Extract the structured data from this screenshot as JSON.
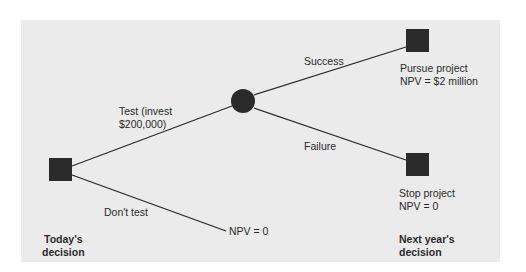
{
  "diagram": {
    "type": "decision-tree",
    "nodes": {
      "today": {
        "shape": "square",
        "kind": "decision"
      },
      "chance": {
        "shape": "circle",
        "kind": "chance"
      },
      "pursue": {
        "shape": "square",
        "kind": "decision",
        "label_line1": "Pursue project",
        "label_line2": "NPV = $2 million"
      },
      "stop": {
        "shape": "square",
        "kind": "decision",
        "label_line1": "Stop project",
        "label_line2": "NPV = 0"
      }
    },
    "branches": {
      "test": {
        "label_line1": "Test (invest",
        "label_line2": "$200,000)"
      },
      "dont_test": {
        "label": "Don't test",
        "outcome": "NPV = 0"
      },
      "success": {
        "label": "Success"
      },
      "failure": {
        "label": "Failure"
      }
    },
    "timeline": {
      "today_line1": "Today's",
      "today_line2": "decision",
      "next_line1": "Next year's",
      "next_line2": "decision"
    },
    "colors": {
      "background": "#ebebeb",
      "node": "#2b2b2b",
      "line": "#2a2a2a"
    }
  }
}
